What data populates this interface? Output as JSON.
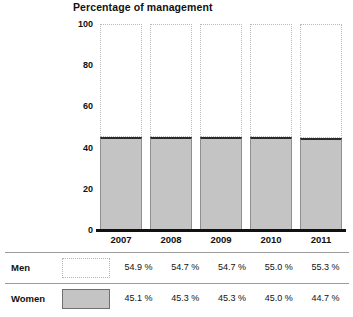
{
  "chart_data": {
    "type": "bar",
    "subtype": "stacked-100-percent",
    "title": "Percentage of management",
    "xlabel": "",
    "ylabel": "",
    "ylim": [
      0,
      100
    ],
    "yticks": [
      0,
      20,
      40,
      60,
      80,
      100
    ],
    "ytick_labels": [
      "0",
      "20",
      "40",
      "60",
      "80",
      "100"
    ],
    "grid": false,
    "legend_position": "bottom-table",
    "categories": [
      "2007",
      "2008",
      "2009",
      "2010",
      "2011"
    ],
    "series": [
      {
        "name": "Men",
        "values": [
          54.9,
          54.7,
          54.7,
          55.0,
          55.3
        ],
        "labels": [
          "54.9 %",
          "54.7 %",
          "54.7 %",
          "55.0 %",
          "55.3 %"
        ],
        "fill": "#ffffff",
        "border": "#b9b9b9",
        "border_style": "dotted"
      },
      {
        "name": "Women",
        "values": [
          45.1,
          45.3,
          45.3,
          45.0,
          44.7
        ],
        "labels": [
          "45.1 %",
          "45.3 %",
          "45.3 %",
          "45.0 %",
          "44.7 %"
        ],
        "fill": "#c4c4c4",
        "border": "#8f8f8f",
        "border_style": "solid"
      }
    ]
  },
  "legend_table": {
    "rows": [
      {
        "label": "Men",
        "values": [
          "54.9 %",
          "54.7 %",
          "54.7 %",
          "55.0 %",
          "55.3 %"
        ]
      },
      {
        "label": "Women",
        "values": [
          "45.1 %",
          "45.3 %",
          "45.3 %",
          "45.0 %",
          "44.7 %"
        ]
      }
    ]
  }
}
